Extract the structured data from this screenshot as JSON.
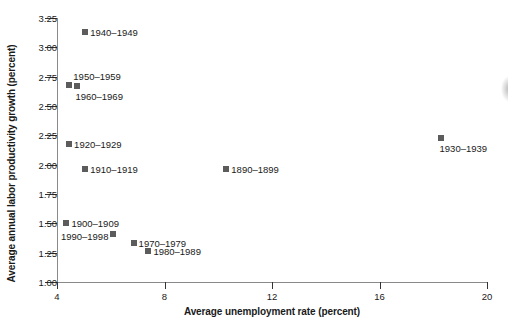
{
  "chart_data": {
    "type": "scatter",
    "title": "",
    "xlabel": "Average unemployment rate (percent)",
    "ylabel": "Average annual labor productivity growth (percent)",
    "xlim": [
      4,
      20
    ],
    "ylim": [
      1.0,
      3.25
    ],
    "xticks": [
      "4",
      "8",
      "12",
      "16",
      "20"
    ],
    "xtick_values": [
      4,
      8,
      12,
      16,
      20
    ],
    "yticks": [
      "1.00",
      "1.25",
      "1.50",
      "1.75",
      "2.00",
      "2.25",
      "2.50",
      "2.75",
      "3.00",
      "3.25"
    ],
    "ytick_values": [
      1.0,
      1.25,
      1.5,
      1.75,
      2.0,
      2.25,
      2.5,
      2.75,
      3.0,
      3.25
    ],
    "grid": false,
    "legend": "none",
    "marker_color": "#5c5c5c",
    "points": [
      {
        "label": "1940–1949",
        "x": 5.05,
        "y": 3.13,
        "label_pos": "right"
      },
      {
        "label": "1950–1959",
        "x": 4.45,
        "y": 2.68,
        "label_pos": "above"
      },
      {
        "label": "1960–1969",
        "x": 4.75,
        "y": 2.67,
        "label_pos": "below"
      },
      {
        "label": "1920–1929",
        "x": 4.45,
        "y": 2.18,
        "label_pos": "right"
      },
      {
        "label": "1910–1919",
        "x": 5.05,
        "y": 1.96,
        "label_pos": "right"
      },
      {
        "label": "1890–1899",
        "x": 10.3,
        "y": 1.96,
        "label_pos": "right"
      },
      {
        "label": "1930–1939",
        "x": 18.3,
        "y": 2.23,
        "label_pos": "below"
      },
      {
        "label": "1900–1909",
        "x": 4.35,
        "y": 1.5,
        "label_pos": "right"
      },
      {
        "label": "1990–1998",
        "x": 6.1,
        "y": 1.41,
        "label_pos": "left"
      },
      {
        "label": "1970–1979",
        "x": 6.85,
        "y": 1.33,
        "label_pos": "right"
      },
      {
        "label": "1980–1989",
        "x": 7.4,
        "y": 1.26,
        "label_pos": "right"
      }
    ]
  }
}
